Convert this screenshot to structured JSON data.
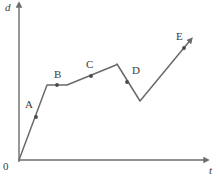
{
  "chart_data": {
    "type": "line",
    "title": "",
    "xlabel": "t",
    "ylabel": "d",
    "origin_label": "0",
    "grid": false,
    "legend": false,
    "axis_color": "#6d6d6d",
    "curve_color": "#6a6a6a",
    "marker_color": "#4a4a4a",
    "text_color": "#3a3a3a",
    "xlim": [
      0,
      219
    ],
    "ylim": [
      0,
      180
    ],
    "vertices": [
      {
        "x": 19,
        "y": 160
      },
      {
        "x": 47,
        "y": 85
      },
      {
        "x": 67,
        "y": 85
      },
      {
        "x": 116,
        "y": 65
      },
      {
        "x": 117,
        "y": 64
      },
      {
        "x": 140,
        "y": 101
      },
      {
        "x": 193,
        "y": 37
      }
    ],
    "points": [
      {
        "name": "A",
        "x": 36,
        "y": 117,
        "label_x": 25,
        "label_y": 99
      },
      {
        "name": "B",
        "x": 57,
        "y": 85,
        "label_x": 54,
        "label_y": 69
      },
      {
        "name": "C",
        "x": 91,
        "y": 76,
        "label_x": 86,
        "label_y": 59
      },
      {
        "name": "D",
        "x": 127,
        "y": 82,
        "label_x": 132,
        "label_y": 65
      },
      {
        "name": "E",
        "x": 184,
        "y": 48,
        "label_x": 176,
        "label_y": 31
      }
    ],
    "y_axis": {
      "x": 19,
      "y_top": 5,
      "y_bottom": 162
    },
    "x_axis": {
      "y": 160,
      "x_left": 19,
      "x_right": 208
    },
    "axis_label_positions": {
      "y": {
        "x": 5,
        "y": 2
      },
      "x": {
        "x": 209,
        "y": 165
      },
      "origin": {
        "x": 3,
        "y": 161
      }
    }
  }
}
